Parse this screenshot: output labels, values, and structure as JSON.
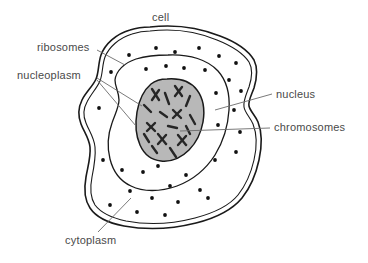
{
  "diagram": {
    "type": "biological-schematic",
    "background_color": "#ffffff",
    "line_color": "#1a1a1a",
    "leader_line_color": "#6b6b6b",
    "label_color": "#4a4a4a",
    "nucleus_fill": "#b8b8b8",
    "cytoplasm_fill": "#ffffff",
    "ribosome_color": "#111111",
    "chromosome_color": "#262626"
  },
  "labels": [
    {
      "id": "cell",
      "text": "cell",
      "position": "top-center",
      "has_leader_line": false
    },
    {
      "id": "ribosomes",
      "text": "ribosomes",
      "position": "upper-left",
      "has_leader_line": true
    },
    {
      "id": "nucleoplasm",
      "text": "nucleoplasm",
      "position": "mid-left",
      "has_leader_line": true
    },
    {
      "id": "nucleus",
      "text": "nucleus",
      "position": "mid-right",
      "has_leader_line": true
    },
    {
      "id": "chromosomes",
      "text": "chromosomes",
      "position": "lower-right",
      "has_leader_line": true
    },
    {
      "id": "cytoplasm",
      "text": "cytoplasm",
      "position": "bottom-left",
      "has_leader_line": true
    }
  ],
  "structures": [
    {
      "id": "cell-membrane",
      "name": "cell membrane",
      "style": "double-line closed irregular outline"
    },
    {
      "id": "cytoplasm",
      "name": "cytoplasm",
      "style": "white interior region"
    },
    {
      "id": "nuclear-envelope",
      "name": "nuclear envelope",
      "style": "single-line closed inner outline"
    },
    {
      "id": "nucleoplasm",
      "name": "nucleoplasm",
      "style": "gray filled rounded blob"
    },
    {
      "id": "chromosomes",
      "name": "chromosomes",
      "style": "dark X and rod shapes inside nucleus"
    },
    {
      "id": "ribosomes",
      "name": "ribosomes",
      "style": "small black dots scattered in cytoplasm"
    }
  ],
  "counts": {
    "ribosome_dots": 34,
    "chromosomes": 14
  }
}
